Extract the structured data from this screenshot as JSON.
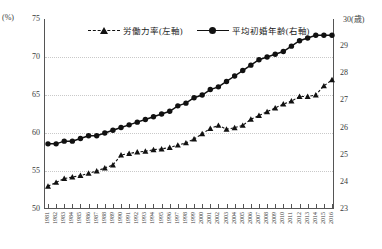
{
  "axes": {
    "left_unit": "(%)",
    "right_unit": "30(歳)",
    "left_ticks": [
      "75",
      "70",
      "65",
      "60",
      "55",
      "50"
    ],
    "right_ticks": [
      "30",
      "29",
      "28",
      "27",
      "26",
      "25",
      "24",
      "23"
    ]
  },
  "legend": {
    "items": [
      {
        "label": "労働力率(左軸)",
        "marker": "triangle-dashed-marker"
      },
      {
        "label": "平均初婚年齢(右軸)",
        "marker": "circle-solid-marker"
      }
    ]
  },
  "chart_data": {
    "type": "line",
    "title": "",
    "xlabel": "",
    "ylabel": "(%)",
    "y2label": "(歳)",
    "ylim": [
      50,
      75
    ],
    "y2lim": [
      23,
      30
    ],
    "grid": true,
    "legend_position": "top-center",
    "x": [
      1981,
      1982,
      1983,
      1984,
      1985,
      1986,
      1987,
      1988,
      1989,
      1990,
      1991,
      1992,
      1993,
      1994,
      1995,
      1996,
      1997,
      1998,
      1999,
      2000,
      2001,
      2002,
      2003,
      2004,
      2005,
      2006,
      2007,
      2008,
      2009,
      2010,
      2011,
      2012,
      2013,
      2014,
      2015,
      2016
    ],
    "tick_labels": [
      "1981",
      "1982",
      "1983",
      "1984",
      "1985",
      "1986",
      "1987",
      "1988",
      "1989",
      "1990",
      "1991",
      "1992",
      "1993",
      "1994",
      "1995",
      "1996",
      "1997",
      "1998",
      "1999",
      "2000",
      "2001",
      "2002",
      "2003",
      "2004",
      "2005",
      "2006",
      "2007",
      "2008",
      "2009",
      "2010",
      "2011",
      "2012",
      "2013",
      "2014",
      "2015",
      "2016"
    ],
    "series": [
      {
        "name": "労働力率(左軸)",
        "axis": "left",
        "unit": "%",
        "marker": "triangle",
        "linestyle": "dashed",
        "values": [
          53.0,
          53.5,
          54.0,
          54.2,
          54.4,
          54.7,
          55.0,
          55.4,
          55.8,
          57.1,
          57.3,
          57.5,
          57.6,
          57.8,
          57.9,
          58.1,
          58.4,
          58.7,
          59.2,
          59.9,
          60.6,
          61.0,
          60.5,
          60.7,
          61.0,
          61.8,
          62.3,
          62.8,
          63.3,
          63.8,
          64.2,
          64.8,
          64.8,
          65.0,
          66.2,
          67.0
        ]
      },
      {
        "name": "平均初婚年齢(右軸)",
        "axis": "right",
        "unit": "歳",
        "marker": "circle",
        "linestyle": "solid",
        "values": [
          25.4,
          25.4,
          25.5,
          25.5,
          25.6,
          25.7,
          25.7,
          25.8,
          25.9,
          26.0,
          26.1,
          26.2,
          26.3,
          26.4,
          26.5,
          26.6,
          26.8,
          26.9,
          27.1,
          27.2,
          27.4,
          27.5,
          27.7,
          27.9,
          28.1,
          28.3,
          28.5,
          28.6,
          28.7,
          28.8,
          29.0,
          29.2,
          29.3,
          29.4,
          29.4,
          29.4
        ]
      }
    ],
    "series_2_extra": {
      "note": ""
    }
  }
}
